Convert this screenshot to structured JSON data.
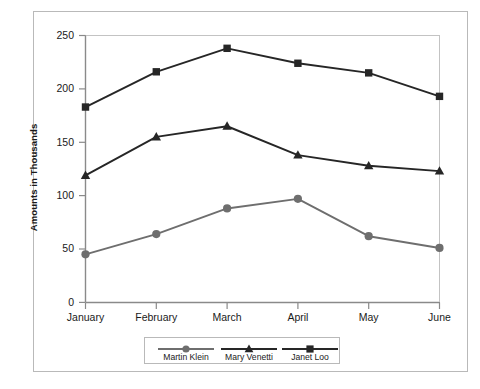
{
  "chart_data": {
    "type": "line",
    "title": "",
    "xlabel": "",
    "ylabel": "Amounts in Thousands",
    "categories": [
      "January",
      "February",
      "March",
      "April",
      "May",
      "June"
    ],
    "ylim": [
      0,
      250
    ],
    "yticks": [
      0,
      50,
      100,
      150,
      200,
      250
    ],
    "grid": false,
    "legend_position": "bottom",
    "series": [
      {
        "name": "Martin Klein",
        "marker": "circle",
        "color": "#6e6e6e",
        "values": [
          45,
          64,
          88,
          97,
          62,
          51
        ]
      },
      {
        "name": "Mary Venetti",
        "marker": "triangle",
        "color": "#262626",
        "values": [
          119,
          155,
          165,
          138,
          128,
          123
        ]
      },
      {
        "name": "Janet Loo",
        "marker": "square",
        "color": "#262626",
        "values": [
          183,
          216,
          238,
          224,
          215,
          193
        ]
      }
    ]
  },
  "axis": {
    "y_title": "Amounts in Thousands",
    "y_labels": [
      "250",
      "200",
      "150",
      "100",
      "50",
      "0"
    ],
    "x_labels": [
      "January",
      "February",
      "March",
      "April",
      "May",
      "June"
    ]
  },
  "legend": {
    "entries": [
      {
        "label": "Martin Klein"
      },
      {
        "label": "Mary Venetti"
      },
      {
        "label": "Janet Loo"
      }
    ]
  },
  "colors": {
    "frame": "#b9b9b9",
    "axis": "#7a7a7a",
    "series_gray": "#6e6e6e",
    "series_dark": "#262626",
    "background": "#ffffff",
    "text": "#1a1a1a"
  }
}
